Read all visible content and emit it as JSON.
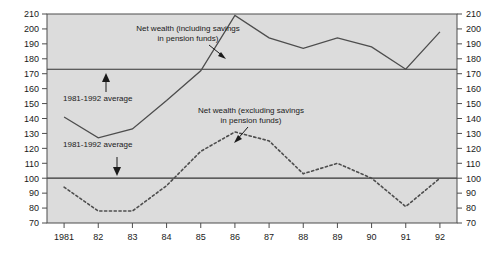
{
  "chart_data": {
    "type": "line",
    "title": "",
    "xlabel": "",
    "ylabel": "",
    "x": [
      1981,
      1982,
      1983,
      1984,
      1985,
      1986,
      1987,
      1988,
      1989,
      1990,
      1991,
      1992
    ],
    "categories": [
      "1981",
      "82",
      "83",
      "84",
      "85",
      "86",
      "87",
      "88",
      "89",
      "90",
      "91",
      "92"
    ],
    "ylim": [
      70,
      210
    ],
    "yticks": [
      70,
      80,
      90,
      100,
      110,
      120,
      130,
      140,
      150,
      160,
      170,
      180,
      190,
      200,
      210
    ],
    "ytick_labels": [
      "70",
      "80",
      "90",
      "100",
      "110",
      "120",
      "130",
      "140",
      "150",
      "160",
      "170",
      "180",
      "190",
      "200",
      "210"
    ],
    "grid": false,
    "legend_position": "none",
    "dual_y_axis": true,
    "series": [
      {
        "name": "Net wealth (including savings in pension funds)",
        "style": "solid",
        "color": "#4d4d4d",
        "values": [
          141,
          127,
          133,
          152,
          172,
          209,
          194,
          187,
          194,
          188,
          173,
          198
        ]
      },
      {
        "name": "Net wealth (excluding savings in pension funds)",
        "style": "dotted",
        "color": "#4d4d4d",
        "values": [
          94,
          78,
          78,
          95,
          118,
          131,
          125,
          103,
          110,
          100,
          81,
          100
        ]
      }
    ],
    "reference_lines": [
      {
        "name": "1981-1992 average (including pension funds)",
        "value": 173,
        "color": "#333333"
      },
      {
        "name": "1981-1992 average (excluding pension funds)",
        "value": 100,
        "color": "#333333"
      }
    ],
    "annotations": [
      {
        "id": "series-1-label",
        "line1": "Net wealth (including savings",
        "line2": "in pension funds)"
      },
      {
        "id": "series-2-label",
        "line1": "Net wealth (excluding savings",
        "line2": "in pension funds)"
      },
      {
        "id": "average-upper-label",
        "text": "1981-1992 average"
      },
      {
        "id": "average-lower-label",
        "text": "1981-1992 average"
      }
    ],
    "plot_background": "#dcdcdc"
  }
}
